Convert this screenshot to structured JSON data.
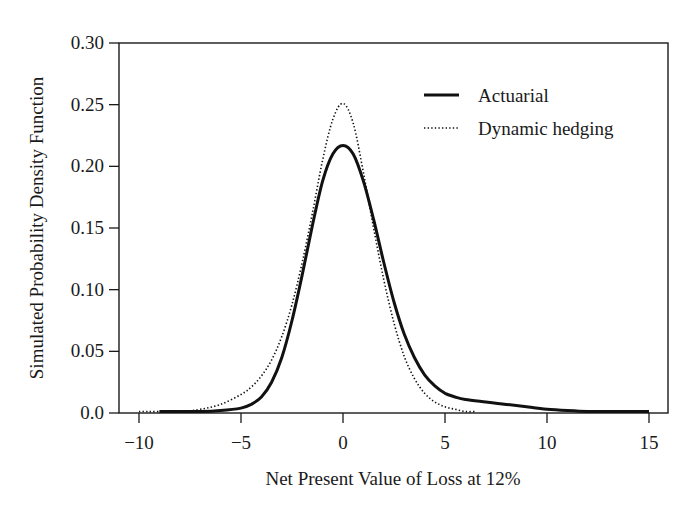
{
  "chart_data": {
    "type": "line",
    "title": "",
    "xlabel": "Net Present Value of Loss at 12%",
    "ylabel": "Simulated Probability Density Function",
    "xlim": [
      -11,
      16
    ],
    "ylim": [
      0,
      0.3
    ],
    "xticks": [
      -10,
      -5,
      0,
      5,
      10,
      15
    ],
    "xtick_labels": [
      "−10",
      "−5",
      "0",
      "5",
      "10",
      "15"
    ],
    "yticks": [
      0.0,
      0.05,
      0.1,
      0.15,
      0.2,
      0.25,
      0.3
    ],
    "ytick_labels": [
      "0.0",
      "0.05",
      "0.10",
      "0.15",
      "0.20",
      "0.25",
      "0.30"
    ],
    "grid": false,
    "legend_position": "upper right",
    "series": [
      {
        "name": "Actuarial",
        "style": "solid",
        "x": [
          -9,
          -7,
          -6,
          -5,
          -4.5,
          -4,
          -3.5,
          -3,
          -2.5,
          -2,
          -1.5,
          -1,
          -0.5,
          0,
          0.5,
          1,
          1.5,
          2,
          2.5,
          3,
          3.5,
          4,
          4.5,
          5,
          5.5,
          6,
          7,
          8,
          9,
          10,
          11,
          12,
          13,
          14,
          15
        ],
        "y": [
          0.0,
          0.001,
          0.002,
          0.004,
          0.007,
          0.013,
          0.025,
          0.045,
          0.075,
          0.112,
          0.152,
          0.188,
          0.21,
          0.217,
          0.21,
          0.188,
          0.157,
          0.122,
          0.09,
          0.064,
          0.045,
          0.031,
          0.022,
          0.016,
          0.013,
          0.011,
          0.009,
          0.007,
          0.005,
          0.003,
          0.002,
          0.001,
          0.001,
          0.0005,
          0.0
        ]
      },
      {
        "name": "Dynamic hedging",
        "style": "dotted",
        "x": [
          -10,
          -8,
          -7,
          -6,
          -5,
          -4.5,
          -4,
          -3.5,
          -3,
          -2.5,
          -2,
          -1.5,
          -1,
          -0.5,
          0,
          0.5,
          1,
          1.5,
          2,
          2.5,
          3,
          3.5,
          4,
          4.5,
          5,
          5.5,
          6,
          6.5
        ],
        "y": [
          0.0,
          0.001,
          0.003,
          0.007,
          0.015,
          0.021,
          0.03,
          0.043,
          0.062,
          0.088,
          0.122,
          0.162,
          0.205,
          0.238,
          0.251,
          0.235,
          0.195,
          0.15,
          0.108,
          0.073,
          0.046,
          0.028,
          0.016,
          0.009,
          0.005,
          0.003,
          0.001,
          0.0
        ]
      }
    ]
  },
  "legend": {
    "items": [
      {
        "label": "Actuarial",
        "style": "solid"
      },
      {
        "label": "Dynamic hedging",
        "style": "dotted"
      }
    ]
  },
  "colors": {
    "line": "#111111",
    "axis": "#1a1a1a"
  }
}
